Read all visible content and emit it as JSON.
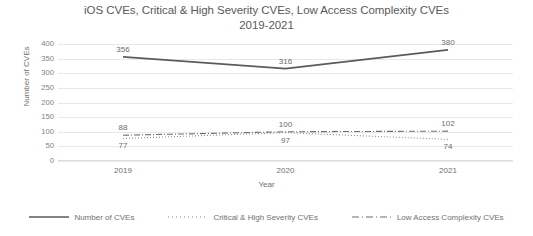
{
  "chart_data": {
    "type": "line",
    "title": "iOS CVEs, Critical & High Severity CVEs, Low Access Complexity CVEs 2019-2021",
    "title_line1": "iOS CVEs, Critical & High Severity CVEs, Low Access Complexity CVEs",
    "title_line2": "2019-2021",
    "xlabel": "Year",
    "ylabel": "Number of CVEs",
    "categories": [
      "2019",
      "2020",
      "2021"
    ],
    "ylim": [
      0,
      400
    ],
    "yticks": [
      "400",
      "350",
      "300",
      "250",
      "200",
      "150",
      "100",
      "50",
      "0"
    ],
    "ytick_values": [
      400,
      350,
      300,
      250,
      200,
      150,
      100,
      50,
      0
    ],
    "grid": true,
    "legend_position": "bottom",
    "series": [
      {
        "name": "Number of CVEs",
        "values": [
          356,
          316,
          380
        ],
        "labels": [
          "356",
          "316",
          "380"
        ],
        "style": "solid",
        "color": "#5b5b5b",
        "label_position": "above"
      },
      {
        "name": "Critical & High Severity CVEs",
        "values": [
          77,
          97,
          74
        ],
        "labels": [
          "77",
          "97",
          "74"
        ],
        "style": "dotted",
        "color": "#8a8a8a",
        "label_position": "below"
      },
      {
        "name": "Low Access Complexity CVEs",
        "values": [
          88,
          100,
          102
        ],
        "labels": [
          "88",
          "100",
          "102"
        ],
        "style": "dashdot",
        "color": "#6f6f6f",
        "label_position": "above"
      }
    ]
  }
}
